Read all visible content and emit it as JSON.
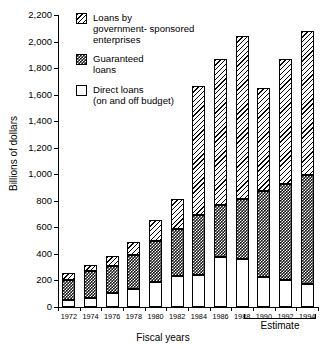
{
  "chart_data": {
    "type": "bar",
    "title": "",
    "subtitle": "",
    "xlabel": "Fiscal years",
    "ylabel": "Billions of dollars",
    "stacked": true,
    "grid": false,
    "legend_position": "inside-top-left",
    "ylim": [
      0,
      2200
    ],
    "ytick_step": 200,
    "ytick_labels": [
      "2,200",
      "2,000",
      "1,800",
      "1,600",
      "1,400",
      "1,200",
      "1,000",
      "800",
      "600",
      "400",
      "200",
      "0"
    ],
    "ytick_values": [
      2200,
      2000,
      1800,
      1600,
      1400,
      1200,
      1000,
      800,
      600,
      400,
      200,
      0
    ],
    "categories": [
      "1972",
      "1974",
      "1976",
      "1978",
      "1980",
      "1982",
      "1984",
      "1986",
      "1988",
      "1990",
      "1992",
      "1994"
    ],
    "series": [
      {
        "name": "Direct loans (on and off budget)",
        "fill": "white",
        "values": [
          50,
          70,
          103,
          138,
          190,
          235,
          240,
          380,
          360,
          225,
          200,
          175
        ]
      },
      {
        "name": "Guaranteed loans",
        "fill": "black-checker",
        "values": [
          150,
          205,
          207,
          252,
          310,
          350,
          450,
          385,
          455,
          650,
          730,
          820
        ]
      },
      {
        "name": "Loans by government- sponsored enterprises",
        "fill": "diagonal-hatch",
        "values": [
          55,
          40,
          75,
          100,
          155,
          230,
          975,
          1100,
          1225,
          775,
          935,
          1085
        ]
      }
    ],
    "totals": [
      255,
      315,
      385,
      490,
      655,
      815,
      1665,
      1865,
      2040,
      1650,
      1865,
      2080
    ],
    "annotations": [
      {
        "text": "Estimate",
        "covers": [
          "1990",
          "1992",
          "1994"
        ]
      }
    ]
  },
  "legend": {
    "items": [
      {
        "icon": "hatch-swatch",
        "label": "Loans by\ngovernment- sponsored\nenterprises",
        "lines": [
          "Loans by",
          "government- sponsored",
          "enterprises"
        ]
      },
      {
        "icon": "checker-swatch",
        "label": "Guaranteed\nloans",
        "lines": [
          "Guaranteed",
          "loans"
        ]
      },
      {
        "icon": "white-swatch",
        "label": "Direct loans\n(on and off budget)",
        "lines": [
          "Direct loans",
          "(on and off budget)"
        ]
      }
    ]
  },
  "axes": {
    "y_title": "Billions of dollars",
    "x_title": "Fiscal years"
  },
  "estimate_note": "Estimate",
  "colors": {
    "ink": "#000000",
    "background": "#ffffff",
    "guaranteed": "#1b1b1b"
  }
}
